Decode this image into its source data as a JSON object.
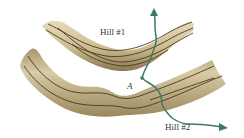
{
  "diagram": {
    "labels": {
      "hill1": "Hill #1",
      "hill2": "Hill #2",
      "point_a": "A"
    },
    "colors": {
      "terrain_light": "#e2d9b8",
      "terrain_dark": "#8b7a52",
      "contour": "#4a3820",
      "path": "#3f7a5f"
    }
  }
}
